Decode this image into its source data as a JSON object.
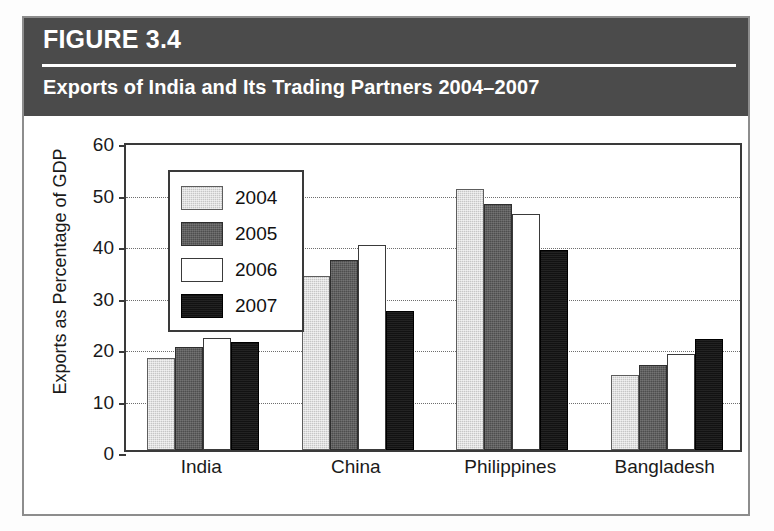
{
  "figure": {
    "label": "FIGURE 3.4",
    "title": "Exports of India and Its Trading Partners 2004–2007",
    "header_bg": "#4b4b4b",
    "header_text_color": "#ffffff",
    "body_bg": "#ffffff",
    "border_color": "#8d8d8d"
  },
  "chart_data": {
    "type": "bar",
    "title": "Exports of India and Its Trading Partners 2004–2007",
    "xlabel": "",
    "ylabel": "Exports as Percentage of GDP",
    "ylim": [
      0,
      60
    ],
    "ytick_values": [
      0,
      10,
      20,
      30,
      40,
      50,
      60
    ],
    "ytick_labels": [
      "0",
      "10",
      "20",
      "30",
      "40",
      "50",
      "60"
    ],
    "grid": true,
    "grid_axis": "y",
    "grid_style": "dotted",
    "legend_position": "upper-left-inside",
    "categories": [
      "India",
      "China",
      "Philippines",
      "Bangladesh"
    ],
    "series": [
      {
        "name": "2004",
        "color": "#c6c6c6",
        "pattern": "light-gray-dither",
        "values": [
          17.9,
          33.8,
          50.7,
          14.6
        ]
      },
      {
        "name": "2005",
        "color": "#4e4e4e",
        "pattern": "dark-gray-dither",
        "values": [
          20.0,
          36.8,
          47.8,
          16.6
        ]
      },
      {
        "name": "2006",
        "color": "#ffffff",
        "pattern": "white-outline",
        "values": [
          21.8,
          39.9,
          45.8,
          18.6
        ]
      },
      {
        "name": "2007",
        "color": "#121212",
        "pattern": "solid-black",
        "values": [
          21.0,
          27.0,
          38.8,
          21.6
        ]
      }
    ]
  }
}
